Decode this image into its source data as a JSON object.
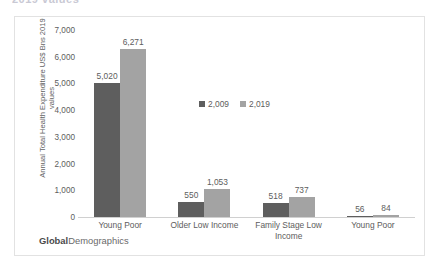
{
  "top_clipped_text": "2019  values",
  "branding": {
    "bold_part": "Global",
    "rest_part": "Demographics"
  },
  "legend": {
    "position": "upper-center",
    "items": [
      {
        "label": "2,009",
        "color": "#5e5e5e"
      },
      {
        "label": "2,019",
        "color": "#a3a3a3"
      }
    ]
  },
  "y_axis": {
    "title": "Annual Total Health Expenditure US$ Bns 2019 values",
    "ticks": [
      "0",
      "1,000",
      "2,000",
      "3,000",
      "4,000",
      "5,000",
      "6,000",
      "7,000"
    ]
  },
  "chart_data": {
    "type": "bar",
    "title": "",
    "subtitle": "",
    "xlabel": "",
    "ylabel": "Annual Total Health Expenditure US$ Bns 2019 values",
    "ylim": [
      0,
      7000
    ],
    "ytick_step": 1000,
    "grid": false,
    "legend_position": "upper-center",
    "categories": [
      "Young Poor",
      "Older Low Income",
      "Family Stage Low Income",
      "Young Poor"
    ],
    "series": [
      {
        "name": "2,009",
        "color": "#5e5e5e",
        "values": [
          5020,
          550,
          518,
          56
        ],
        "labels": [
          "5,020",
          "550",
          "518",
          "56"
        ]
      },
      {
        "name": "2,019",
        "color": "#a3a3a3",
        "values": [
          6271,
          1053,
          737,
          84
        ],
        "labels": [
          "6,271",
          "1,053",
          "737",
          "84"
        ]
      }
    ]
  }
}
